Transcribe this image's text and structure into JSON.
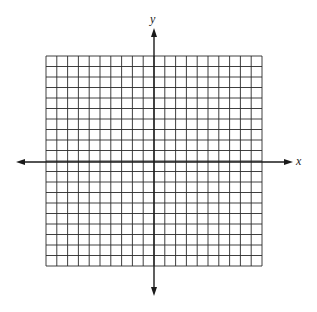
{
  "figure": {
    "type": "coordinate-plane",
    "background": "#ffffff",
    "line_color": "#1a1a1a",
    "grid_color": "#2a2a2a"
  },
  "grid": {
    "columns": 20,
    "rows": 20,
    "left": 46,
    "top": 56,
    "right": 262,
    "bottom": 266
  },
  "axes": {
    "x": {
      "label": "x",
      "y_position": 162,
      "start": 16,
      "end": 293,
      "label_x": 296,
      "label_y": 155
    },
    "y": {
      "label": "y",
      "x_position": 154,
      "start": 28,
      "end": 296,
      "label_x": 150,
      "label_y": 13
    }
  }
}
